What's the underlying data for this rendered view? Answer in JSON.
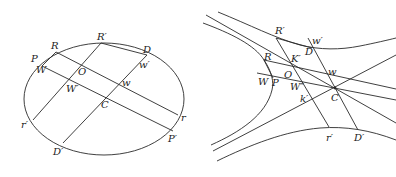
{
  "figures": [
    {
      "id": "ellipse",
      "description": "Ellipse with conjugate diameters and parallel chords",
      "labels": {
        "R": "R",
        "R_prime": "R′",
        "D": "D",
        "P": "P",
        "W": "W",
        "O": "O",
        "w_prime": "w′",
        "w": "w",
        "W_prime": "W′",
        "C": "C",
        "r": "r",
        "r_prime": "r′",
        "P_prime": "P′",
        "D_prime": "D′"
      }
    },
    {
      "id": "hyperbola",
      "description": "Conjugate hyperbolas with asymptotes and chords through centre C",
      "labels": {
        "R_prime": "R′",
        "w_prime": "w′",
        "D": "D",
        "R": "R",
        "K_prime": "K′",
        "O": "O",
        "w": "w",
        "W": "W",
        "P": "P",
        "W_dprime": "W″",
        "C": "C",
        "k_prime": "k′",
        "r_prime": "r′",
        "D_prime": "D′"
      }
    }
  ],
  "colors": {
    "stroke": "#2a2a2a",
    "text": "#222222",
    "background": "#ffffff"
  }
}
